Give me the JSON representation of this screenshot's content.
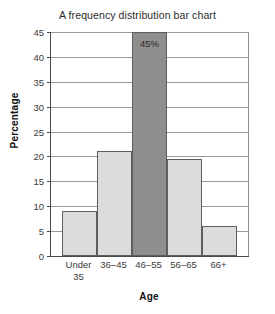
{
  "chart_data": {
    "type": "bar",
    "title": "A frequency distribution bar chart",
    "xlabel": "Age",
    "ylabel": "Percentage",
    "categories": [
      "Under\n35",
      "36–45",
      "46–55",
      "56–65",
      "66+"
    ],
    "values": [
      9,
      21,
      45,
      19.5,
      6
    ],
    "ylim": [
      0,
      45
    ],
    "ytick_labels": [
      "45",
      "40",
      "35",
      "30",
      "25",
      "20",
      "15",
      "10",
      "5",
      "0"
    ],
    "ytick_values": [
      45,
      40,
      35,
      30,
      25,
      20,
      15,
      10,
      5,
      0
    ],
    "ytick_step": 5,
    "grid": true,
    "legend": "none",
    "annotations": [
      {
        "series_index": 2,
        "text": "45%",
        "position": "inside-top"
      }
    ],
    "bar_colors": [
      "#dcdcdc",
      "#dcdcdc",
      "#8e8e8e",
      "#dcdcdc",
      "#dcdcdc"
    ],
    "bar_edge_color": "#5e5e5e",
    "highlight_index": 2,
    "axis_color": "#4a4a4a",
    "grid_color": "#9a9a9a",
    "background_color": "#ffffff"
  }
}
